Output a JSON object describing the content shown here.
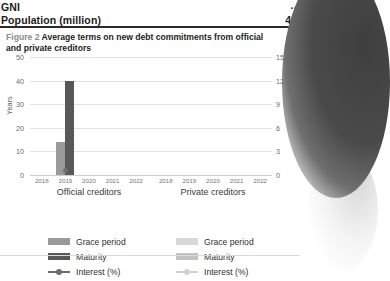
{
  "table": {
    "rows": [
      {
        "label": "GNI",
        "value": ".."
      },
      {
        "label": "Population (million)",
        "value": "41"
      }
    ]
  },
  "figure": {
    "number": "Figure 2",
    "title": "Average terms on new debt commitments from official and private creditors"
  },
  "legend": {
    "official": [
      {
        "label": "Grace period",
        "type": "bar",
        "color": "#9a9a9a"
      },
      {
        "label": "Maturity",
        "type": "bar",
        "color": "#585858"
      },
      {
        "label": "Interest (%)",
        "type": "line",
        "color": "#6e6e6e"
      }
    ],
    "private": [
      {
        "label": "Grace period",
        "type": "bar",
        "color": "#d8d8d8"
      },
      {
        "label": "Maturity",
        "type": "bar",
        "color": "#c2c2c2"
      },
      {
        "label": "Interest (%)",
        "type": "line",
        "color": "#d0d0d0"
      }
    ]
  },
  "chart_data": {
    "type": "bar",
    "title": "Average terms on new debt commitments from official and private creditors",
    "xlabel": "",
    "ylabel": "Years",
    "y2label": "Interest (%)",
    "ylim": [
      0,
      50
    ],
    "y2lim": [
      0,
      15
    ],
    "yticks": [
      0,
      10,
      20,
      30,
      40,
      50
    ],
    "y2ticks": [
      0,
      3,
      6,
      9,
      12,
      15
    ],
    "grid": true,
    "legend_position": "bottom",
    "panels": [
      {
        "name": "Official creditors",
        "categories": [
          "2018",
          "2019",
          "2020",
          "2021",
          "2022"
        ],
        "series": [
          {
            "name": "Grace period",
            "axis": "left",
            "unit": "years",
            "values": [
              null,
              14,
              null,
              null,
              null
            ]
          },
          {
            "name": "Maturity",
            "axis": "left",
            "unit": "years",
            "values": [
              null,
              40,
              null,
              null,
              null
            ]
          },
          {
            "name": "Interest (%)",
            "axis": "right",
            "unit": "percent",
            "values": [
              null,
              0.6,
              null,
              null,
              null
            ]
          }
        ]
      },
      {
        "name": "Private creditors",
        "categories": [
          "2018",
          "2019",
          "2020",
          "2021",
          "2022"
        ],
        "series": [
          {
            "name": "Grace period",
            "axis": "left",
            "unit": "years",
            "values": [
              null,
              null,
              null,
              null,
              null
            ]
          },
          {
            "name": "Maturity",
            "axis": "left",
            "unit": "years",
            "values": [
              null,
              null,
              null,
              null,
              null
            ]
          },
          {
            "name": "Interest (%)",
            "axis": "right",
            "unit": "percent",
            "values": [
              null,
              null,
              null,
              null,
              null
            ]
          }
        ]
      }
    ]
  }
}
